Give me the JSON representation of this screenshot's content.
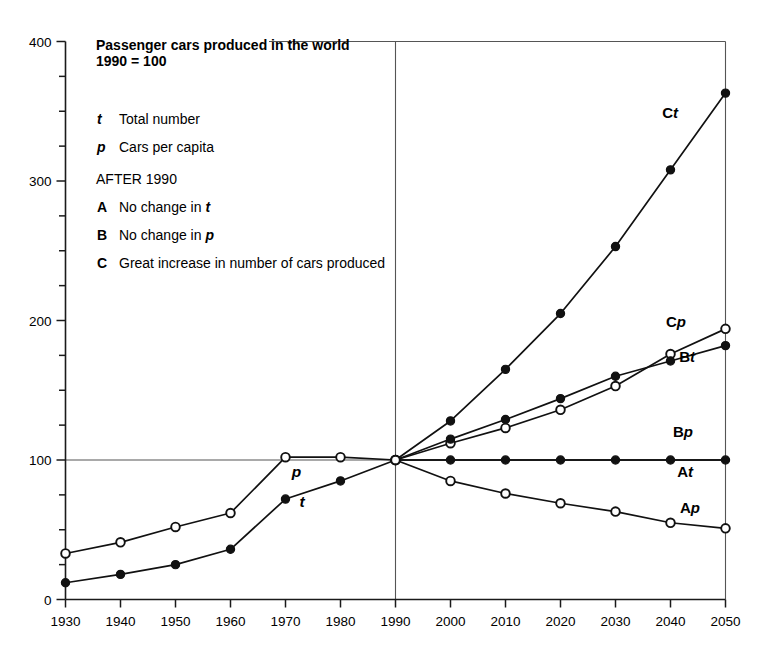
{
  "chart_data": {
    "type": "line",
    "title": "Passenger cars produced in the world",
    "subtitle": "1990 = 100",
    "xlabel": "",
    "ylabel": "",
    "xlim": [
      1930,
      2050
    ],
    "ylim": [
      0,
      400
    ],
    "x_ticks": [
      1930,
      1940,
      1950,
      1960,
      1970,
      1980,
      1990,
      2000,
      2010,
      2020,
      2030,
      2040,
      2050
    ],
    "y_ticks": [
      0,
      100,
      200,
      300,
      400
    ],
    "y_minor_step": 25,
    "grid": false,
    "legend_position": "upper-left-inside",
    "reference_lines": [
      {
        "type": "vertical",
        "value": 1990
      },
      {
        "type": "horizontal",
        "value": 100
      },
      {
        "type": "horizontal",
        "value": 400,
        "partial_from": 1967
      },
      {
        "type": "vertical",
        "value": 2050
      }
    ],
    "legend": [
      {
        "key": "t",
        "key_style": "italic",
        "text": "Total number"
      },
      {
        "key": "p",
        "key_style": "italic",
        "text": "Cars per capita"
      },
      {
        "key": "",
        "key_style": "none",
        "text": "AFTER 1990"
      },
      {
        "key": "A",
        "key_style": "bold",
        "text": "No change in ",
        "text_italic_suffix": "t"
      },
      {
        "key": "B",
        "key_style": "bold",
        "text": "No change in ",
        "text_italic_suffix": "p"
      },
      {
        "key": "C",
        "key_style": "bold",
        "text": "Great increase in number of cars produced",
        "text_italic_suffix": ""
      }
    ],
    "series": [
      {
        "name": "t",
        "label": "t",
        "label_prefix": "",
        "label_italic": "t",
        "marker": "filled",
        "period": "historical",
        "x": [
          1930,
          1940,
          1950,
          1960,
          1970,
          1980,
          1990
        ],
        "values": [
          12,
          18,
          25,
          36,
          72,
          85,
          100
        ]
      },
      {
        "name": "p",
        "label": "p",
        "label_prefix": "",
        "label_italic": "p",
        "marker": "open",
        "period": "historical",
        "x": [
          1930,
          1940,
          1950,
          1960,
          1970,
          1980,
          1990
        ],
        "values": [
          33,
          41,
          52,
          62,
          102,
          102,
          100
        ]
      },
      {
        "name": "Ct",
        "label": "Ct",
        "label_prefix": "C",
        "label_italic": "t",
        "marker": "filled",
        "period": "projection",
        "x": [
          1990,
          2000,
          2010,
          2020,
          2030,
          2040,
          2050
        ],
        "values": [
          100,
          128,
          165,
          205,
          253,
          308,
          363
        ]
      },
      {
        "name": "Cp",
        "label": "Cp",
        "label_prefix": "C",
        "label_italic": "p",
        "marker": "open",
        "period": "projection",
        "x": [
          1990,
          2000,
          2010,
          2020,
          2030,
          2040,
          2050
        ],
        "values": [
          100,
          112,
          123,
          136,
          153,
          176,
          194
        ]
      },
      {
        "name": "Bt",
        "label": "Bt",
        "label_prefix": "B",
        "label_italic": "t",
        "marker": "filled",
        "period": "projection",
        "x": [
          1990,
          2000,
          2010,
          2020,
          2030,
          2040,
          2050
        ],
        "values": [
          100,
          115,
          129,
          144,
          160,
          171,
          182
        ]
      },
      {
        "name": "Bp",
        "label": "Bp",
        "label_prefix": "B",
        "label_italic": "p",
        "marker": "filled",
        "period": "projection",
        "x": [
          1990,
          2000,
          2010,
          2020,
          2030,
          2040,
          2050
        ],
        "values": [
          100,
          100,
          100,
          100,
          100,
          100,
          100
        ]
      },
      {
        "name": "At",
        "label": "At",
        "label_prefix": "A",
        "label_italic": "t",
        "marker": "none",
        "period": "projection",
        "x": [
          1990,
          2050
        ],
        "values": [
          100,
          100
        ]
      },
      {
        "name": "Ap",
        "label": "Ap",
        "label_prefix": "A",
        "label_italic": "p",
        "marker": "open",
        "period": "projection",
        "x": [
          1990,
          2000,
          2010,
          2020,
          2030,
          2040,
          2050
        ],
        "values": [
          100,
          85,
          76,
          69,
          63,
          55,
          51
        ]
      }
    ],
    "inline_annotations": [
      {
        "text": "p",
        "series": "p",
        "x": 1972,
        "y": 88,
        "italic": true
      },
      {
        "text": "t",
        "series": "t",
        "x": 1973,
        "y": 66,
        "italic": true
      }
    ],
    "colors": {
      "line": "#111111",
      "axis": "#1a1a1a",
      "reference": "#555555",
      "background": "#ffffff",
      "marker_fill_open": "#ffffff"
    }
  }
}
